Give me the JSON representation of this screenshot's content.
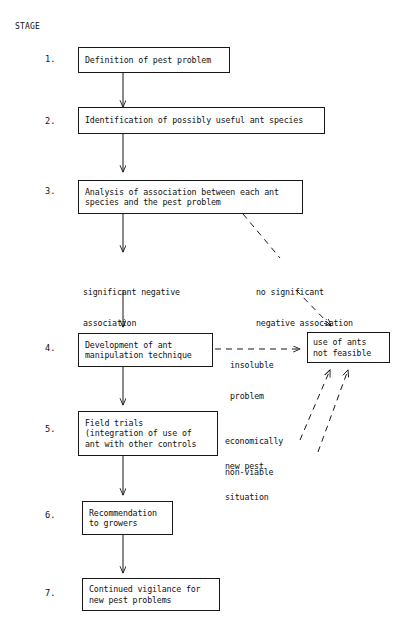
{
  "header": {
    "stage_column_label": "STAGE"
  },
  "stages": [
    {
      "number": "1.",
      "lines": [
        "Definition of pest problem"
      ]
    },
    {
      "number": "2.",
      "lines": [
        "Identification of possibly useful ant species"
      ]
    },
    {
      "number": "3.",
      "lines": [
        "Analysis of association between each ant",
        "species and the pest problem"
      ]
    },
    {
      "number": "4.",
      "lines": [
        "Development of ant",
        "manipulation technique"
      ]
    },
    {
      "number": "5.",
      "lines": [
        "Field trials",
        "(integration of use of",
        "ant with other controls"
      ]
    },
    {
      "number": "6.",
      "lines": [
        "Recommendation",
        "to growers"
      ]
    },
    {
      "number": "7.",
      "lines": [
        "Continued vigilance for",
        "new pest problems"
      ]
    }
  ],
  "terminal_node": {
    "lines": [
      "use of ants",
      "not feasible"
    ]
  },
  "edge_labels": {
    "significant_negative": [
      "significant negative",
      "association"
    ],
    "no_significant_negative": [
      "no significant",
      "negative association"
    ],
    "insoluble_problem": [
      "insoluble",
      "problem"
    ],
    "economically_non_viable": [
      "economically",
      "non-viable"
    ],
    "new_pest_situation": [
      "new pest",
      "situation"
    ]
  },
  "colors": {
    "ink": "#171717",
    "text": "#111111",
    "paper": "#ffffff"
  }
}
